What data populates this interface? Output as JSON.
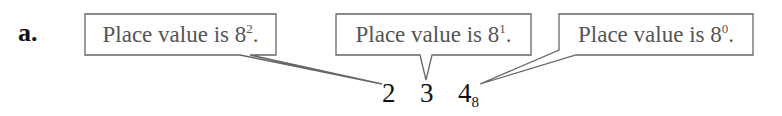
{
  "problem_label": "a.",
  "callouts": [
    {
      "text": "Place value is 8",
      "exponent": "2",
      "suffix": ".",
      "points_to": "2"
    },
    {
      "text": "Place value is 8",
      "exponent": "1",
      "suffix": ".",
      "points_to": "3"
    },
    {
      "text": "Place value is 8",
      "exponent": "0",
      "suffix": ".",
      "points_to": "4"
    }
  ],
  "number": {
    "digits": [
      "2",
      "3",
      "4"
    ],
    "base": "8"
  },
  "colors": {
    "box_stroke": "#666666",
    "callout_text": "#555555",
    "digits": "#111111"
  }
}
